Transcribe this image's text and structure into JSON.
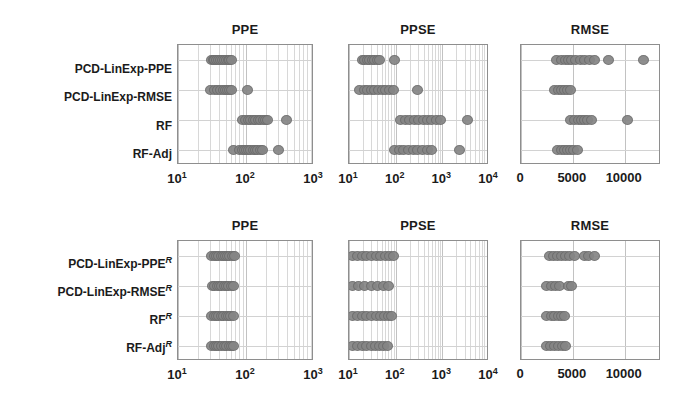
{
  "figure": {
    "row_groups": [
      {
        "id": "top",
        "row_labels": [
          {
            "text": "PCD-LinExp-PPE",
            "sup": ""
          },
          {
            "text": "PCD-LinExp-RMSE",
            "sup": ""
          },
          {
            "text": "RF",
            "sup": ""
          },
          {
            "text": "RF-Adj",
            "sup": ""
          }
        ]
      },
      {
        "id": "bottom",
        "row_labels": [
          {
            "text": "PCD-LinExp-PPE",
            "sup": "R"
          },
          {
            "text": "PCD-LinExp-RMSE",
            "sup": "R"
          },
          {
            "text": "RF",
            "sup": "R"
          },
          {
            "text": "RF-Adj",
            "sup": "R"
          }
        ]
      }
    ]
  },
  "chart_data": [
    {
      "id": "top-ppe",
      "type": "scatter",
      "title": "PPE",
      "xlabel": "",
      "ylabel": "",
      "xscale": "log",
      "xlim": [
        10,
        1000
      ],
      "xticks": [
        10,
        100,
        1000
      ],
      "xticklabels": [
        "10^1",
        "10^2",
        "10^3"
      ],
      "grid": true,
      "categories": [
        "PCD-LinExp-PPE",
        "PCD-LinExp-RMSE",
        "RF",
        "RF-Adj"
      ],
      "series": [
        {
          "name": "PCD-LinExp-PPE",
          "values": [
            31,
            33,
            35,
            37,
            39,
            42,
            45,
            48,
            52,
            55,
            58,
            61
          ]
        },
        {
          "name": "PCD-LinExp-RMSE",
          "values": [
            30,
            34,
            38,
            42,
            46,
            50,
            54,
            58,
            62,
            105
          ]
        },
        {
          "name": "RF",
          "values": [
            88,
            98,
            108,
            118,
            128,
            140,
            152,
            165,
            178,
            192,
            205,
            400
          ]
        },
        {
          "name": "RF-Adj",
          "values": [
            66,
            80,
            88,
            95,
            102,
            110,
            118,
            128,
            138,
            150,
            162,
            175,
            300
          ]
        }
      ]
    },
    {
      "id": "top-ppse",
      "type": "scatter",
      "title": "PPSE",
      "xlabel": "",
      "ylabel": "",
      "xscale": "log",
      "xlim": [
        10,
        10000
      ],
      "xticks": [
        10,
        100,
        1000,
        10000
      ],
      "xticklabels": [
        "10^1",
        "10^2",
        "10^3",
        "10^4"
      ],
      "grid": true,
      "categories": [
        "PCD-LinExp-PPE",
        "PCD-LinExp-RMSE",
        "RF",
        "RF-Adj"
      ],
      "series": [
        {
          "name": "PCD-LinExp-PPE",
          "values": [
            19,
            22,
            25,
            28,
            32,
            36,
            40,
            44,
            95
          ]
        },
        {
          "name": "PCD-LinExp-RMSE",
          "values": [
            17,
            21,
            25,
            30,
            36,
            43,
            51,
            61,
            73,
            88,
            300
          ]
        },
        {
          "name": "RF",
          "values": [
            130,
            160,
            200,
            250,
            310,
            390,
            480,
            600,
            740,
            920,
            3500
          ]
        },
        {
          "name": "RF-Adj",
          "values": [
            95,
            120,
            150,
            190,
            240,
            300,
            380,
            470,
            590,
            2300
          ]
        }
      ]
    },
    {
      "id": "top-rmse",
      "type": "scatter",
      "title": "RMSE",
      "xlabel": "",
      "ylabel": "",
      "xscale": "linear",
      "xlim": [
        0,
        13500
      ],
      "xticks": [
        0,
        5000,
        10000
      ],
      "xticklabels": [
        "0",
        "5000",
        "10000"
      ],
      "grid": true,
      "categories": [
        "PCD-LinExp-PPE",
        "PCD-LinExp-RMSE",
        "RF",
        "RF-Adj"
      ],
      "series": [
        {
          "name": "PCD-LinExp-PPE",
          "values": [
            3400,
            3900,
            4300,
            4600,
            4900,
            5300,
            5700,
            6100,
            6600,
            7100,
            8400,
            11800
          ]
        },
        {
          "name": "PCD-LinExp-RMSE",
          "values": [
            3200,
            3600,
            3900,
            4200,
            4500,
            4800
          ]
        },
        {
          "name": "RF",
          "values": [
            4800,
            5200,
            5500,
            5800,
            6100,
            6400,
            6800,
            10300
          ]
        },
        {
          "name": "RF-Adj",
          "values": [
            3500,
            3900,
            4200,
            4500,
            4800,
            5100,
            5400
          ]
        }
      ]
    },
    {
      "id": "bottom-ppe",
      "type": "scatter",
      "title": "PPE",
      "xlabel": "",
      "ylabel": "",
      "xscale": "log",
      "xlim": [
        10,
        1000
      ],
      "xticks": [
        10,
        100,
        1000
      ],
      "xticklabels": [
        "10^1",
        "10^2",
        "10^3"
      ],
      "grid": true,
      "categories": [
        "PCD-LinExp-PPE^R",
        "PCD-LinExp-RMSE^R",
        "RF^R",
        "RF-Adj^R"
      ],
      "series": [
        {
          "name": "PCD-LinExp-PPE^R",
          "values": [
            31,
            34,
            37,
            40,
            43,
            46,
            50,
            54,
            58,
            63,
            68
          ]
        },
        {
          "name": "PCD-LinExp-RMSE^R",
          "values": [
            32,
            35,
            38,
            41,
            44,
            48,
            52,
            56,
            61,
            66
          ]
        },
        {
          "name": "RF^R",
          "values": [
            31,
            34,
            37,
            40,
            43,
            47,
            51,
            55,
            60,
            65
          ]
        },
        {
          "name": "RF-Adj^R",
          "values": [
            31,
            34,
            37,
            40,
            44,
            48,
            52,
            57,
            62,
            66
          ]
        }
      ]
    },
    {
      "id": "bottom-ppse",
      "type": "scatter",
      "title": "PPSE",
      "xlabel": "",
      "ylabel": "",
      "xscale": "log",
      "xlim": [
        10,
        10000
      ],
      "xticks": [
        10,
        100,
        1000,
        10000
      ],
      "xticklabels": [
        "10^1",
        "10^2",
        "10^3",
        "10^4"
      ],
      "grid": true,
      "categories": [
        "PCD-LinExp-PPE^R",
        "PCD-LinExp-RMSE^R",
        "RF^R",
        "RF-Adj^R"
      ],
      "series": [
        {
          "name": "PCD-LinExp-PPE^R",
          "values": [
            12,
            15,
            19,
            24,
            30,
            38,
            48,
            60,
            75,
            92
          ]
        },
        {
          "name": "PCD-LinExp-RMSE^R",
          "values": [
            12,
            16,
            22,
            30,
            41,
            56,
            70
          ]
        },
        {
          "name": "RF^R",
          "values": [
            12,
            15,
            19,
            24,
            30,
            38,
            48,
            58,
            70,
            82
          ]
        },
        {
          "name": "RF-Adj^R",
          "values": [
            12,
            15,
            19,
            24,
            30,
            37,
            46,
            56,
            68
          ]
        }
      ]
    },
    {
      "id": "bottom-rmse",
      "type": "scatter",
      "title": "RMSE",
      "xlabel": "",
      "ylabel": "",
      "xscale": "linear",
      "xlim": [
        0,
        13500
      ],
      "xticks": [
        0,
        5000,
        10000
      ],
      "xticklabels": [
        "0",
        "5000",
        "10000"
      ],
      "grid": true,
      "categories": [
        "PCD-LinExp-PPE^R",
        "PCD-LinExp-RMSE^R",
        "RF^R",
        "RF-Adj^R"
      ],
      "series": [
        {
          "name": "PCD-LinExp-PPE^R",
          "values": [
            2700,
            3100,
            3500,
            3900,
            4300,
            4700,
            5200,
            6100,
            6500,
            7100
          ]
        },
        {
          "name": "PCD-LinExp-RMSE^R",
          "values": [
            2500,
            2900,
            3300,
            3700,
            4600,
            4900
          ]
        },
        {
          "name": "RF^R",
          "values": [
            2500,
            2900,
            3200,
            3600,
            3900,
            4200
          ]
        },
        {
          "name": "RF-Adj^R",
          "values": [
            2500,
            2800,
            3200,
            3600,
            4000,
            4300
          ]
        }
      ]
    }
  ]
}
